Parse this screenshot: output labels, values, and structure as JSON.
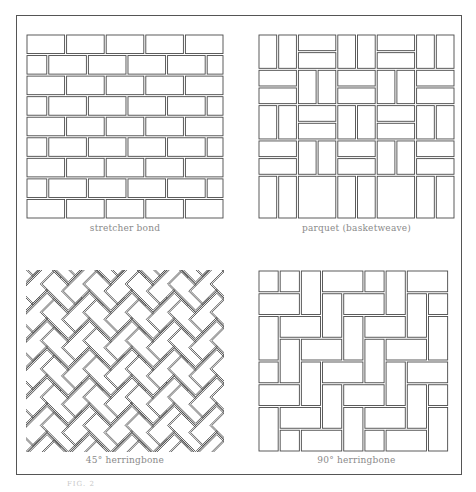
{
  "colors": {
    "stroke": "#4a4a4a",
    "caption": "#8a8a8a",
    "frame": "#555555"
  },
  "panels": [
    {
      "id": "stretcher",
      "caption": "stretcher bond",
      "pattern": "stretcher",
      "x": 26,
      "y": 34,
      "w": 198,
      "h": 185,
      "rows": 9,
      "bricks_per_row": 5
    },
    {
      "id": "parquet",
      "caption": "parquet (basketweave)",
      "pattern": "parquet",
      "x": 258,
      "y": 34,
      "w": 197,
      "h": 185,
      "cells_x": 5,
      "cells_y": 5
    },
    {
      "id": "herring45",
      "caption": "45° herringbone",
      "pattern": "herringbone45",
      "x": 26,
      "y": 270,
      "w": 198,
      "h": 182
    },
    {
      "id": "herring90",
      "caption": "90° herringbone",
      "pattern": "herringbone90",
      "x": 258,
      "y": 270,
      "w": 197,
      "h": 182
    }
  ],
  "captions": {
    "stretcher": "stretcher bond",
    "parquet": "parquet (basketweave)",
    "herring45": "45° herringbone",
    "herring90": "90° herringbone"
  },
  "footer": "FIG. 2"
}
